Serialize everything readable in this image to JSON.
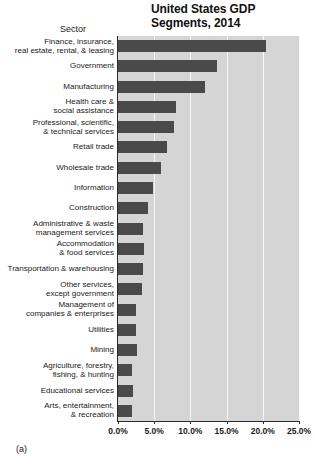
{
  "figure": {
    "panel_label": "(a)",
    "colors": {
      "bar": "#4a4a4a",
      "plot_background": "#d5d5d5",
      "gridline": "#f7f7f7",
      "axis": "#2b2b2b",
      "text": "#1a1a1a"
    }
  },
  "chart_data": {
    "type": "bar",
    "orientation": "horizontal",
    "title": "United States GDP\nSegments, 2014",
    "xlabel": "",
    "ylabel": "Sector",
    "xlim": [
      0,
      25
    ],
    "xticks": [
      0,
      5,
      10,
      15,
      20,
      25
    ],
    "xtick_labels": [
      "0.0%",
      "5.0%",
      "10.0%",
      "15.0%",
      "20.0%",
      "25.0%"
    ],
    "grid": true,
    "legend": false,
    "categories": [
      "Finance, insurance,\nreal estate, rental, & leasing",
      "Government",
      "Manufacturing",
      "Health care &\nsocial assistance",
      "Professional, scientific,\n& technical services",
      "Retail trade",
      "Wholesale trade",
      "Information",
      "Construction",
      "Administrative & waste\nmanagement services",
      "Accommodation\n& food services",
      "Transportation & warehousing",
      "Other services,\nexcept government",
      "Management of\ncompanies & enterprises",
      "Utilities",
      "Mining",
      "Agriculture, forestry,\nfishing, & hunting",
      "Educational services",
      "Arts, entertainment,\n& recreation"
    ],
    "values": [
      20.4,
      13.7,
      12.0,
      8.0,
      7.8,
      6.7,
      5.9,
      4.9,
      4.1,
      3.5,
      3.6,
      3.5,
      3.3,
      2.5,
      2.5,
      2.6,
      2.0,
      2.1,
      2.0
    ],
    "value_labels": [
      "20.4%",
      "13.7%",
      "12.0%",
      "8.0%",
      "7.8%",
      "6.7%",
      "5.9%",
      "4.9%",
      "4.1%",
      "3.5%",
      "3.6%",
      "3.5%",
      "3.3%",
      "2.5%",
      "2.5%",
      "2.6%",
      "2.0%",
      "2.1%",
      "2.0%"
    ]
  }
}
